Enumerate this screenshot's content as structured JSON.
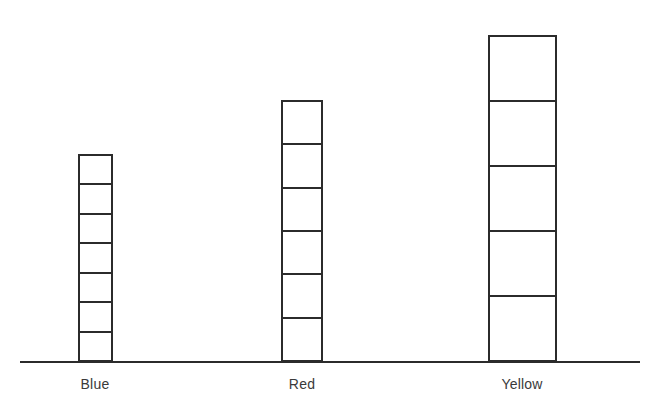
{
  "chart_data": {
    "type": "bar",
    "title": "",
    "subtitle": "",
    "xlabel": "",
    "ylabel": "",
    "categories": [
      "Blue",
      "Red",
      "Yellow"
    ],
    "values": [
      7,
      6,
      5
    ],
    "unit": "blocks",
    "series": [
      {
        "name": "blocks",
        "values": [
          7,
          6,
          5
        ]
      }
    ],
    "ylim": [
      0,
      7
    ],
    "grid": false,
    "legend": null,
    "annotations": []
  },
  "axis": {
    "baseline_color": "#2b2b2b",
    "baseline_visible": true,
    "tick_labels": [
      "Blue",
      "Red",
      "Yellow"
    ]
  },
  "bars": [
    {
      "id": "blue",
      "label": "Blue",
      "blocks": 7,
      "outline_color": "#2b2b2b",
      "fill_color": "#ffffff"
    },
    {
      "id": "red",
      "label": "Red",
      "blocks": 6,
      "outline_color": "#2b2b2b",
      "fill_color": "#ffffff"
    },
    {
      "id": "yellow",
      "label": "Yellow",
      "blocks": 5,
      "outline_color": "#2b2b2b",
      "fill_color": "#ffffff"
    }
  ],
  "palette": {
    "background": "#ffffff",
    "stroke": "#2b2b2b",
    "label_text": "#3a3a3a"
  }
}
